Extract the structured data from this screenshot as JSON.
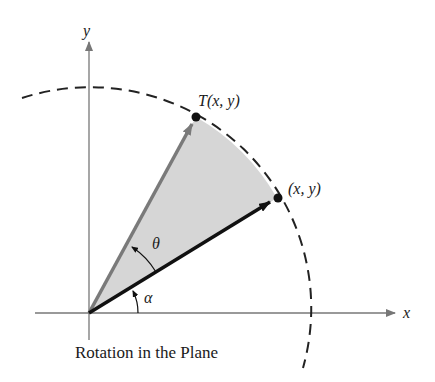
{
  "diagram": {
    "caption": "Rotation in the Plane",
    "axes": {
      "x_label": "x",
      "y_label": "y"
    },
    "points": {
      "original": {
        "label": "(x, y)"
      },
      "rotated": {
        "label": "T(x, y)"
      }
    },
    "angles": {
      "alpha": "α",
      "theta": "θ"
    },
    "colors": {
      "sector_fill": "#d6d6d6",
      "original_vector": "#111111",
      "rotated_vector": "#7a7a7a",
      "axes": "#777777",
      "circle": "#222222"
    }
  }
}
